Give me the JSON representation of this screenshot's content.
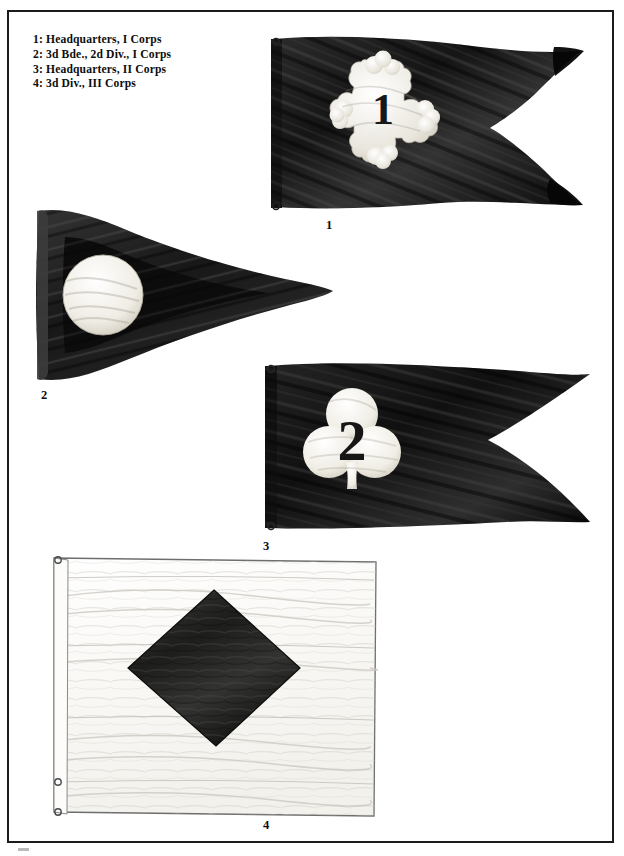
{
  "plate": {
    "width": 624,
    "height": 856,
    "background_color": "#ffffff",
    "frame_color": "#1b1b1b"
  },
  "legend": {
    "lines": [
      "1: Headquarters, I Corps",
      "2: 3d Bde., 2d Div., I Corps",
      "3: Headquarters, II Corps",
      "4: 3d Div., III Corps"
    ]
  },
  "figures": [
    {
      "number": "1",
      "caption": "1",
      "legend_text": "Headquarters, I Corps",
      "flag_shape": "swallowtail-guidon",
      "field_color": "#1a1a1a",
      "emblem": "cross-botonny",
      "emblem_color": "#f2f0ea",
      "emblem_numeral": "1",
      "emblem_numeral_color": "#1a1a1a",
      "hoist_grommets": 2
    },
    {
      "number": "2",
      "caption": "2",
      "legend_text": "3d Bde., 2d Div., I Corps",
      "flag_shape": "triangular-pennant",
      "field_color": "#1a1a1a",
      "border_color": "#3d3d3d",
      "emblem": "disc",
      "emblem_color": "#f4f2ec",
      "emblem_numeral": "",
      "hoist_grommets": 0
    },
    {
      "number": "3",
      "caption": "3",
      "legend_text": "Headquarters, II Corps",
      "flag_shape": "swallowtail-guidon",
      "field_color": "#141414",
      "emblem": "trefoil",
      "emblem_color": "#f5f3ee",
      "emblem_numeral": "2",
      "emblem_numeral_color": "#161616",
      "hoist_grommets": 2
    },
    {
      "number": "4",
      "caption": "4",
      "legend_text": "3d Div., III Corps",
      "flag_shape": "rectangular",
      "field_color": "#fbfbf9",
      "border_color": "#6e6e6e",
      "emblem": "lozenge-diamond",
      "emblem_color": "#262626",
      "emblem_numeral": "",
      "hoist_grommets": 3
    }
  ]
}
